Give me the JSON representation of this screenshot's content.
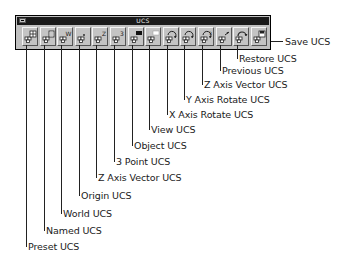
{
  "window": {
    "title": "UCS",
    "system_menu_icon": "system-menu-icon"
  },
  "buttons": [
    {
      "id": "preset-ucs",
      "label": "Preset UCS",
      "icon": "preset-ucs-icon",
      "glyph": "grid"
    },
    {
      "id": "named-ucs",
      "label": "Named UCS",
      "icon": "named-ucs-icon",
      "glyph": "doc"
    },
    {
      "id": "world-ucs",
      "label": "World UCS",
      "icon": "world-ucs-icon",
      "glyph": "W"
    },
    {
      "id": "origin-ucs",
      "label": "Origin UCS",
      "icon": "origin-ucs-icon",
      "glyph": "origin"
    },
    {
      "id": "z-axis-vector-ucs",
      "label": "Z Axis Vector UCS",
      "icon": "z-axis-vector-ucs-icon",
      "glyph": "Z"
    },
    {
      "id": "3-point-ucs",
      "label": "3 Point UCS",
      "icon": "3-point-ucs-icon",
      "glyph": "3"
    },
    {
      "id": "object-ucs",
      "label": "Object UCS",
      "icon": "object-ucs-icon",
      "glyph": "objblack"
    },
    {
      "id": "view-ucs",
      "label": "View UCS",
      "icon": "view-ucs-icon",
      "glyph": "viewwhite"
    },
    {
      "id": "x-axis-rotate-ucs",
      "label": "X Axis Rotate UCS",
      "icon": "x-axis-rotate-ucs-icon",
      "glyph": "rotX"
    },
    {
      "id": "y-axis-rotate-ucs",
      "label": "Y Axis Rotate UCS",
      "icon": "y-axis-rotate-ucs-icon",
      "glyph": "rotY"
    },
    {
      "id": "z-axis-rotate-ucs",
      "label": "Z Axis Vector UCS",
      "icon": "z-axis-rotate-ucs-icon",
      "glyph": "rotZ"
    },
    {
      "id": "previous-ucs",
      "label": "Previous UCS",
      "icon": "previous-ucs-icon",
      "glyph": "prev"
    },
    {
      "id": "restore-ucs",
      "label": "Restore UCS",
      "icon": "restore-ucs-icon",
      "glyph": "restore"
    },
    {
      "id": "save-ucs",
      "label": "Save UCS",
      "icon": "save-ucs-icon",
      "glyph": "save"
    }
  ]
}
